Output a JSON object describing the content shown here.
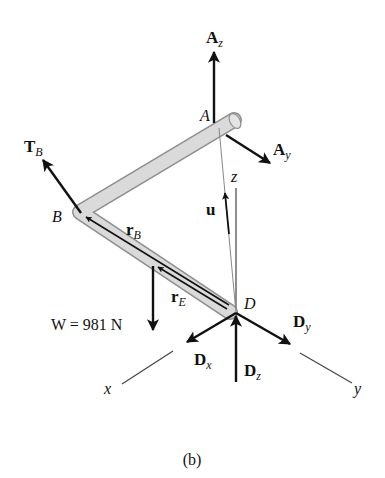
{
  "figure": {
    "caption": "(b)",
    "colors": {
      "background": "#ffffff",
      "rod_fill": "#d9d9d9",
      "rod_outline": "#9a9a9a",
      "force_arrow": "#111111",
      "axis_line": "#333333"
    }
  },
  "points": {
    "A": {
      "label": "A"
    },
    "B": {
      "label": "B"
    },
    "D": {
      "label": "D"
    }
  },
  "axes": {
    "x": {
      "label": "x"
    },
    "y": {
      "label": "y"
    },
    "z": {
      "label": "z"
    }
  },
  "forces": {
    "Az": {
      "main": "A",
      "sub": "z"
    },
    "Ay": {
      "main": "A",
      "sub": "y"
    },
    "TB": {
      "main": "T",
      "sub": "B"
    },
    "W": {
      "text": "W = 981 N"
    },
    "Dx": {
      "main": "D",
      "sub": "x"
    },
    "Dy": {
      "main": "D",
      "sub": "y"
    },
    "Dz": {
      "main": "D",
      "sub": "z"
    }
  },
  "vectors": {
    "rB": {
      "main": "r",
      "sub": "B"
    },
    "rE": {
      "main": "r",
      "sub": "E"
    },
    "u": {
      "main": "u"
    }
  }
}
